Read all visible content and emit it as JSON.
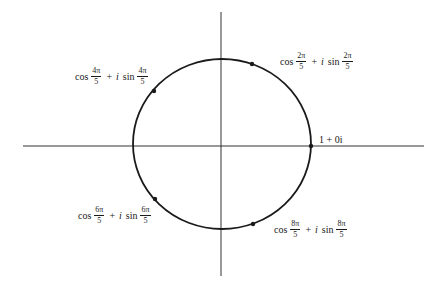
{
  "diagram": {
    "type": "unit-circle-roots-of-unity",
    "colors": {
      "stroke": "#1a1a1a",
      "axis": "#333333",
      "background": "#ffffff"
    },
    "center": [
      222,
      146
    ],
    "radius_x": 89,
    "radius_y": 87,
    "axes": {
      "horizontal": {
        "x1": 23,
        "x2": 424,
        "y": 146
      },
      "vertical": {
        "x": 221,
        "y1": 12,
        "y2": 276
      }
    },
    "points": [
      {
        "id": "k0",
        "x": 311,
        "y": 146,
        "label": {
          "text": "1 + 0i",
          "plain": true
        }
      },
      {
        "id": "k1",
        "x": 252,
        "y": 64,
        "label": {
          "fn1": "cos",
          "num1": "2π",
          "den1": "5",
          "op": "+",
          "i": "i",
          "fn2": "sin",
          "num2": "2π",
          "den2": "5"
        }
      },
      {
        "id": "k2",
        "x": 154,
        "y": 91,
        "label": {
          "fn1": "cos",
          "num1": "4π",
          "den1": "5",
          "op": "+",
          "i": "i",
          "fn2": "sin",
          "num2": "4π",
          "den2": "5"
        }
      },
      {
        "id": "k3",
        "x": 155,
        "y": 199,
        "label": {
          "fn1": "cos",
          "num1": "6π",
          "den1": "5",
          "op": "+",
          "i": "i",
          "fn2": "sin",
          "num2": "6π",
          "den2": "5"
        }
      },
      {
        "id": "k4",
        "x": 253,
        "y": 224,
        "label": {
          "fn1": "cos",
          "num1": "8π",
          "den1": "5",
          "op": "+",
          "i": "i",
          "fn2": "sin",
          "num2": "8π",
          "den2": "5"
        }
      }
    ],
    "labels": {
      "k0": "1 + 0i",
      "k1": "cos 2π/5 + i sin 2π/5",
      "k2": "cos 4π/5 + i sin 4π/5",
      "k3": "cos 6π/5 + i sin 6π/5",
      "k4": "cos 8π/5 + i sin 8π/5"
    }
  }
}
